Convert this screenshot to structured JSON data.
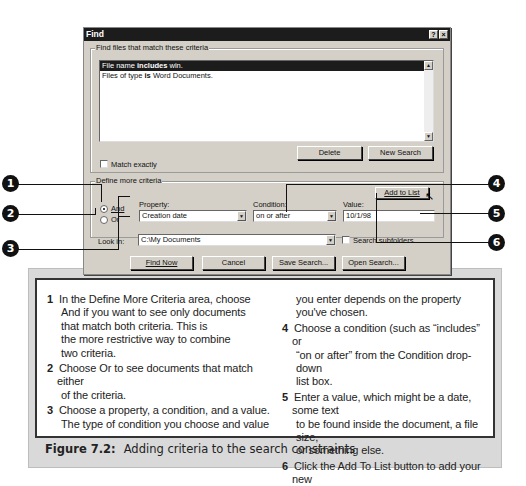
{
  "dialog": {
    "title": "Find",
    "help_button": "?",
    "close_button": "×",
    "criteria_group_label": "Find files that match these criteria",
    "criteria_list": [
      {
        "prefix": "File name ",
        "bold": "includes",
        "suffix": " win.",
        "selected": true
      },
      {
        "prefix": "Files of type ",
        "bold": "is",
        "suffix": " Word Documents.",
        "selected": false
      }
    ],
    "match_exactly_label": "Match exactly",
    "match_exactly_checked": false,
    "delete_button": "Delete",
    "new_search_button": "New Search",
    "define_group_label": "Define more criteria",
    "and_label": "And",
    "or_label": "Or",
    "and_selected": true,
    "property_label": "Property:",
    "property_value": "Creation date",
    "condition_label": "Condition:",
    "condition_value": "on or after",
    "value_label": "Value:",
    "value_value": "10/1/98",
    "add_to_list_button": "Add to List",
    "look_in_label": "Look in:",
    "look_in_value": "C:\\My Documents",
    "search_subfolders_label": "Search subfolders",
    "search_subfolders_checked": false,
    "find_now_button": "Find Now",
    "cancel_button": "Cancel",
    "save_search_button": "Save Search...",
    "open_search_button": "Open Search..."
  },
  "callouts": [
    "1",
    "2",
    "3",
    "4",
    "5",
    "6"
  ],
  "steps": [
    {
      "num": "1",
      "text": "In the Define More Criteria area, choose",
      "cont": [
        "And if you want to see only documents",
        "that match both criteria. This is",
        "the more restrictive way to combine",
        "two criteria."
      ]
    },
    {
      "num": "2",
      "text": "Choose Or to see documents that match either",
      "cont": [
        "of the criteria."
      ]
    },
    {
      "num": "3",
      "text": "Choose a property, a condition, and a value.",
      "cont": [
        "The type of condition you choose and value",
        "you enter depends on the property",
        "you've chosen."
      ]
    },
    {
      "num": "4",
      "text": "Choose a condition (such as “includes” or",
      "cont": [
        "“on or after” from the Condition drop-down",
        "list box."
      ]
    },
    {
      "num": "5",
      "text": "Enter a value, which might be a date, some text",
      "cont": [
        "to be found inside the document, a file size,",
        "or something else."
      ]
    },
    {
      "num": "6",
      "text": "Click the Add To List button to add your new",
      "cont": [
        "criterion to the box at the top."
      ]
    }
  ],
  "caption": {
    "label": "Figure 7.2:",
    "text": "Adding criteria to the search constraints"
  }
}
